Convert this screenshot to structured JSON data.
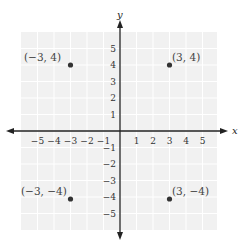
{
  "diagram": {
    "type": "coordinate-plane",
    "colors": {
      "background": "#ffffff",
      "grid_fill": "#f1f1f1",
      "grid_line": "#ffffff",
      "axis": "#222222",
      "point": "#333333",
      "label": "#444444"
    },
    "axes": {
      "x_label": "x",
      "y_label": "y",
      "x_ticks": [
        "-5",
        "-4",
        "-3",
        "-2",
        "-1",
        "1",
        "2",
        "3",
        "4",
        "5"
      ],
      "y_ticks": [
        "5",
        "4",
        "3",
        "2",
        "1",
        "-1",
        "-2",
        "-3",
        "-4",
        "-5"
      ],
      "x_range": [
        -6,
        6
      ],
      "y_range": [
        -6,
        6
      ]
    },
    "points": [
      {
        "x": -3,
        "y": 4,
        "label": "(−3, 4)"
      },
      {
        "x": 3,
        "y": 4,
        "label": "(3, 4)"
      },
      {
        "x": -3,
        "y": -4,
        "label": "(−3, −4)"
      },
      {
        "x": 3,
        "y": -4,
        "label": "(3, −4)"
      }
    ]
  }
}
